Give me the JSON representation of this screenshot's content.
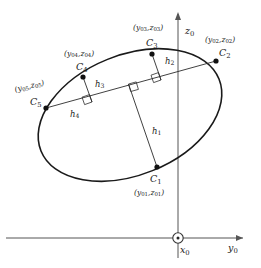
{
  "figure": {
    "type": "geometry-diagram",
    "axes": {
      "vertical": {
        "name": "z0",
        "symbol": "z",
        "subscript": "0"
      },
      "horizontal": {
        "name": "y0",
        "symbol": "y",
        "subscript": "0"
      },
      "out_of_plane": {
        "name": "x0",
        "symbol": "x",
        "subscript": "0",
        "marker": "circle-dot-out-of-page"
      }
    },
    "points": [
      {
        "id": "C1",
        "symbol": "C",
        "subscript": "1",
        "coord_label": "(y01,z01)",
        "coord_y": "y",
        "coord_y_sub": "01",
        "coord_z": "z",
        "coord_z_sub": "01",
        "x": 157,
        "y": 167
      },
      {
        "id": "C2",
        "symbol": "C",
        "subscript": "2",
        "coord_label": "(y02,z02)",
        "coord_y": "y",
        "coord_y_sub": "02",
        "coord_z": "z",
        "coord_z_sub": "02",
        "x": 216,
        "y": 61
      },
      {
        "id": "C3",
        "symbol": "C",
        "subscript": "3",
        "coord_label": "(y03,z03)",
        "coord_y": "y",
        "coord_y_sub": "03",
        "coord_z": "z",
        "coord_z_sub": "03",
        "x": 152,
        "y": 54
      },
      {
        "id": "C4",
        "symbol": "C",
        "subscript": "4",
        "coord_label": "(y04,z04)",
        "coord_y": "y",
        "coord_y_sub": "04",
        "coord_z": "z",
        "coord_z_sub": "04",
        "x": 83,
        "y": 77
      },
      {
        "id": "C5",
        "symbol": "C",
        "subscript": "5",
        "coord_label": "(y05,z05)",
        "coord_y": "y",
        "coord_y_sub": "05",
        "coord_z": "z",
        "coord_z_sub": "05",
        "x": 46,
        "y": 108
      }
    ],
    "distances": [
      {
        "id": "h1",
        "symbol": "h",
        "subscript": "1",
        "from_point": "C1",
        "right_angle": true
      },
      {
        "id": "h2",
        "symbol": "h",
        "subscript": "2",
        "from_point": "C3",
        "right_angle": true
      },
      {
        "id": "h3",
        "symbol": "h",
        "subscript": "3",
        "from_point": "C4",
        "right_angle": true
      },
      {
        "id": "h4",
        "symbol": "h",
        "subscript": "4",
        "from_point": "C5",
        "right_angle": false
      }
    ],
    "chord": {
      "from": "C5",
      "to": "C2"
    },
    "colors": {
      "ellipse_stroke": "#1a1a1a",
      "line_stroke": "#2b2b2b",
      "axis_stroke": "#555555",
      "marker_fill": "#111111",
      "text": "#1a1a1a"
    }
  }
}
